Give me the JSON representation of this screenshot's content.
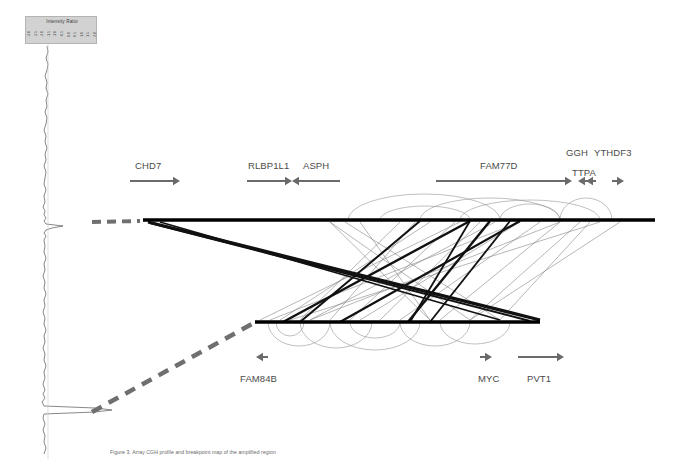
{
  "figure": {
    "type": "genomic-rearrangement-diagram",
    "background_color": "#ffffff",
    "caption": "Figure 3. Array CGH profile and breakpoint map of the amplified region"
  },
  "legend": {
    "title": "Intensity Ratio",
    "box_color": "#d2d2d2",
    "ticks": [
      "-3.0",
      "-2.5",
      "-2.0",
      "-1.5",
      "-1.0",
      "-0.5",
      "0.0",
      "0.5",
      "1.0",
      "1.5",
      "2.0"
    ]
  },
  "genes": {
    "top_track": [
      {
        "name": "CHD7",
        "label_x": 135,
        "label_y": 160,
        "arrow": "right",
        "arrow_x1": 130,
        "arrow_x2": 180,
        "arrow_y": 181
      },
      {
        "name": "RLBP1L1",
        "label_x": 248,
        "label_y": 160,
        "arrow": "right",
        "arrow_x1": 247,
        "arrow_x2": 292,
        "arrow_y": 181
      },
      {
        "name": "ASPH",
        "label_x": 303,
        "label_y": 160,
        "arrow": "left",
        "arrow_x1": 340,
        "arrow_x2": 292,
        "arrow_y": 181
      },
      {
        "name": "FAM77D",
        "label_x": 480,
        "label_y": 160,
        "arrow": "right",
        "arrow_x1": 436,
        "arrow_x2": 572,
        "arrow_y": 181
      },
      {
        "name": "TTPA",
        "label_x": 572,
        "label_y": 167,
        "arrow": "left",
        "arrow_x1": 588,
        "arrow_x2": 578,
        "arrow_y": 181
      },
      {
        "name": "GGH",
        "label_x": 566,
        "label_y": 147,
        "arrow": "left",
        "arrow_x1": 596,
        "arrow_x2": 586,
        "arrow_y": 181
      },
      {
        "name": "YTHDF3",
        "label_x": 594,
        "label_y": 147,
        "arrow": "right",
        "arrow_x1": 612,
        "arrow_x2": 624,
        "arrow_y": 181
      }
    ],
    "bottom_track": [
      {
        "name": "FAM84B",
        "label_x": 240,
        "label_y": 373,
        "arrow": "left",
        "arrow_x1": 268,
        "arrow_x2": 256,
        "arrow_y": 357
      },
      {
        "name": "MYC",
        "label_x": 478,
        "label_y": 373,
        "arrow": "right",
        "arrow_x1": 480,
        "arrow_x2": 492,
        "arrow_y": 357
      },
      {
        "name": "PVT1",
        "label_x": 527,
        "label_y": 373,
        "arrow": "right",
        "arrow_x1": 518,
        "arrow_x2": 564,
        "arrow_y": 357
      }
    ]
  },
  "chart_data": {
    "type": "line",
    "title": "Intensity Ratio",
    "orientation": "vertical",
    "xlabel": "Intensity Ratio",
    "ylabel": "Genomic position",
    "xlim": [
      -3.0,
      2.0
    ],
    "ylim": [
      0,
      459
    ],
    "grid": false,
    "legend_position": "top-left",
    "baseline_x": 48,
    "series": [
      {
        "name": "log2 ratio trace",
        "color": "#555555",
        "points": [
          [
            47,
            46
          ],
          [
            48,
            52
          ],
          [
            46,
            58
          ],
          [
            48,
            64
          ],
          [
            47,
            70
          ],
          [
            45,
            76
          ],
          [
            47,
            82
          ],
          [
            46,
            88
          ],
          [
            48,
            94
          ],
          [
            46,
            100
          ],
          [
            47,
            106
          ],
          [
            45,
            112
          ],
          [
            47,
            118
          ],
          [
            46,
            124
          ],
          [
            44,
            130
          ],
          [
            46,
            136
          ],
          [
            45,
            142
          ],
          [
            47,
            148
          ],
          [
            45,
            154
          ],
          [
            46,
            160
          ],
          [
            44,
            166
          ],
          [
            46,
            172
          ],
          [
            45,
            178
          ],
          [
            44,
            184
          ],
          [
            46,
            190
          ],
          [
            44,
            196
          ],
          [
            45,
            202
          ],
          [
            43,
            207
          ],
          [
            45,
            211
          ],
          [
            44,
            215
          ],
          [
            46,
            218
          ],
          [
            44,
            221
          ],
          [
            46,
            224
          ],
          [
            63,
            226
          ],
          [
            52,
            228
          ],
          [
            46,
            230
          ],
          [
            44,
            233
          ],
          [
            46,
            236
          ],
          [
            44,
            240
          ],
          [
            45,
            246
          ],
          [
            44,
            252
          ],
          [
            46,
            258
          ],
          [
            44,
            264
          ],
          [
            45,
            270
          ],
          [
            43,
            276
          ],
          [
            45,
            282
          ],
          [
            44,
            288
          ],
          [
            46,
            294
          ],
          [
            44,
            300
          ],
          [
            45,
            306
          ],
          [
            43,
            312
          ],
          [
            45,
            318
          ],
          [
            44,
            324
          ],
          [
            46,
            330
          ],
          [
            44,
            336
          ],
          [
            45,
            342
          ],
          [
            43,
            348
          ],
          [
            45,
            354
          ],
          [
            44,
            360
          ],
          [
            46,
            366
          ],
          [
            44,
            372
          ],
          [
            45,
            378
          ],
          [
            43,
            384
          ],
          [
            45,
            390
          ],
          [
            43,
            394
          ],
          [
            45,
            398
          ],
          [
            42,
            402
          ],
          [
            44,
            406
          ],
          [
            95,
            408
          ],
          [
            112,
            410
          ],
          [
            95,
            412
          ],
          [
            44,
            414
          ],
          [
            43,
            418
          ],
          [
            45,
            424
          ],
          [
            43,
            430
          ],
          [
            45,
            436
          ],
          [
            44,
            442
          ],
          [
            46,
            448
          ],
          [
            44,
            454
          ]
        ]
      }
    ],
    "amplification_peaks": [
      {
        "y": 226,
        "magnitude": 0.35,
        "label": "minor peak"
      },
      {
        "y": 410,
        "magnitude": 1.9,
        "label": "high-level amplification"
      }
    ]
  },
  "ideogram": {
    "top_bar": {
      "x1": 143,
      "x2": 655,
      "y": 220,
      "thickness": 3.5,
      "color": "#000000"
    },
    "bottom_bar": {
      "x1": 255,
      "x2": 540,
      "y": 322,
      "thickness": 3.5,
      "color": "#000000"
    },
    "connectors": [
      {
        "name": "top-dashed-connector",
        "x1": 92,
        "y1": 222,
        "x2": 140,
        "y2": 221,
        "color": "#6f6f6f",
        "width": 4,
        "dash": "9 6"
      },
      {
        "name": "bottom-dashed-connector",
        "x1": 92,
        "y1": 412,
        "x2": 252,
        "y2": 324,
        "color": "#6f6f6f",
        "width": 4.5,
        "dash": "11 8"
      }
    ]
  },
  "rearrangements": {
    "heavy_lines": [
      {
        "x1": 148,
        "y1": 222,
        "x2": 540,
        "y2": 320,
        "width": 3.2
      },
      {
        "x1": 150,
        "y1": 223,
        "x2": 530,
        "y2": 321,
        "width": 2.0
      },
      {
        "x1": 160,
        "y1": 222,
        "x2": 500,
        "y2": 320,
        "width": 1.6
      },
      {
        "x1": 283,
        "y1": 322,
        "x2": 470,
        "y2": 221,
        "width": 2.4
      },
      {
        "x1": 340,
        "y1": 322,
        "x2": 520,
        "y2": 221,
        "width": 2.2
      },
      {
        "x1": 408,
        "y1": 322,
        "x2": 490,
        "y2": 221,
        "width": 2.4
      },
      {
        "x1": 420,
        "y1": 221,
        "x2": 300,
        "y2": 322,
        "width": 2.0
      },
      {
        "x1": 470,
        "y1": 221,
        "x2": 410,
        "y2": 322,
        "width": 1.8
      },
      {
        "x1": 510,
        "y1": 221,
        "x2": 430,
        "y2": 322,
        "width": 1.8
      }
    ],
    "thin_lines": [
      {
        "x1": 330,
        "y1": 222,
        "x2": 470,
        "y2": 320
      },
      {
        "x1": 345,
        "y1": 222,
        "x2": 500,
        "y2": 320
      },
      {
        "x1": 360,
        "y1": 222,
        "x2": 430,
        "y2": 320
      },
      {
        "x1": 400,
        "y1": 222,
        "x2": 300,
        "y2": 320
      },
      {
        "x1": 415,
        "y1": 222,
        "x2": 330,
        "y2": 320
      },
      {
        "x1": 430,
        "y1": 222,
        "x2": 280,
        "y2": 320
      },
      {
        "x1": 455,
        "y1": 222,
        "x2": 350,
        "y2": 320
      },
      {
        "x1": 480,
        "y1": 222,
        "x2": 380,
        "y2": 320
      },
      {
        "x1": 495,
        "y1": 222,
        "x2": 310,
        "y2": 320
      },
      {
        "x1": 520,
        "y1": 222,
        "x2": 360,
        "y2": 320
      },
      {
        "x1": 540,
        "y1": 222,
        "x2": 400,
        "y2": 320
      },
      {
        "x1": 560,
        "y1": 222,
        "x2": 440,
        "y2": 320
      },
      {
        "x1": 580,
        "y1": 222,
        "x2": 470,
        "y2": 320
      },
      {
        "x1": 290,
        "y1": 320,
        "x2": 600,
        "y2": 222
      },
      {
        "x1": 310,
        "y1": 320,
        "x2": 560,
        "y2": 222
      },
      {
        "x1": 270,
        "y1": 320,
        "x2": 520,
        "y2": 222
      },
      {
        "x1": 470,
        "y1": 320,
        "x2": 620,
        "y2": 222
      },
      {
        "x1": 500,
        "y1": 320,
        "x2": 590,
        "y2": 222
      },
      {
        "x1": 260,
        "y1": 320,
        "x2": 460,
        "y2": 222
      },
      {
        "x1": 430,
        "y1": 320,
        "x2": 330,
        "y2": 222
      }
    ],
    "arcs_top": [
      {
        "x1": 348,
        "x2": 500,
        "height": 26
      },
      {
        "x1": 420,
        "x2": 560,
        "height": 22
      },
      {
        "x1": 460,
        "x2": 600,
        "height": 20
      },
      {
        "x1": 560,
        "x2": 612,
        "height": 22
      },
      {
        "x1": 500,
        "x2": 560,
        "height": 16
      },
      {
        "x1": 380,
        "x2": 470,
        "height": 14
      }
    ],
    "arcs_bottom": [
      {
        "x1": 268,
        "x2": 330,
        "height": 24
      },
      {
        "x1": 300,
        "x2": 372,
        "height": 26
      },
      {
        "x1": 330,
        "x2": 420,
        "height": 28
      },
      {
        "x1": 400,
        "x2": 470,
        "height": 24
      },
      {
        "x1": 440,
        "x2": 510,
        "height": 22
      },
      {
        "x1": 276,
        "x2": 304,
        "height": 14
      },
      {
        "x1": 350,
        "x2": 400,
        "height": 16
      }
    ]
  }
}
